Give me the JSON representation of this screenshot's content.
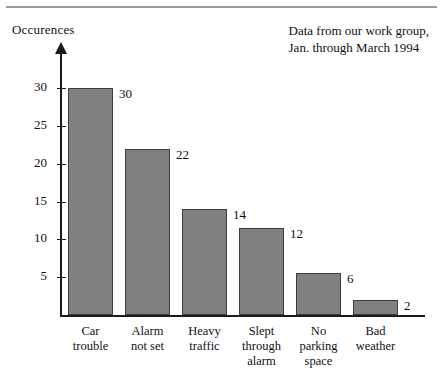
{
  "figure": {
    "y_axis_title": "Occurences",
    "note_line1": "Data from our work group,",
    "note_line2": "Jan. through March 1994"
  },
  "chart_data": {
    "type": "bar",
    "title": "",
    "xlabel": "",
    "ylabel": "Occurences",
    "categories": [
      "Car trouble",
      "Alarm not set",
      "Heavy traffic",
      "Slept through alarm",
      "No parking space",
      "Bad weather"
    ],
    "category_lines": [
      [
        "Car",
        "trouble"
      ],
      [
        "Alarm",
        "not set"
      ],
      [
        "Heavy",
        "traffic"
      ],
      [
        "Slept",
        "through",
        "alarm"
      ],
      [
        "No",
        "parking",
        "space"
      ],
      [
        "Bad",
        "weather"
      ]
    ],
    "values": [
      30,
      22,
      14,
      11.5,
      5.5,
      2
    ],
    "value_labels": [
      "30",
      "22",
      "14",
      "12",
      "6",
      "2"
    ],
    "ylim": [
      0,
      31.5
    ],
    "yticks": [
      5,
      10,
      15,
      20,
      25,
      30
    ],
    "ytick_labels": [
      "5",
      "10",
      "15",
      "20",
      "25",
      "30"
    ],
    "grid": false,
    "legend": "none",
    "bar_color": "#808080",
    "bar_edge_color": "#3d3d3d",
    "axis_color": "#1a1a1a"
  }
}
